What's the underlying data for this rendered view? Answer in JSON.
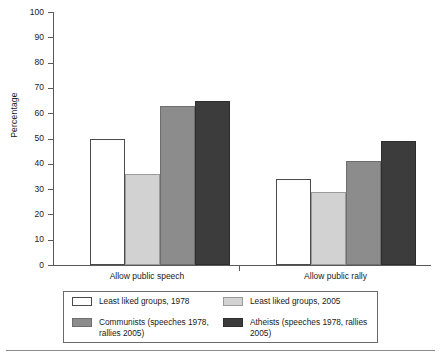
{
  "chart_data": {
    "type": "bar",
    "title": "",
    "xlabel": "",
    "ylabel": "Percentage",
    "ylim": [
      0,
      100
    ],
    "ytick_step": 10,
    "yticks": [
      100,
      90,
      80,
      70,
      60,
      50,
      40,
      30,
      20,
      10,
      0
    ],
    "grid": false,
    "legend_position": "bottom",
    "categories": [
      "Allow public speech",
      "Allow public rally"
    ],
    "series": [
      {
        "name": "Least liked groups, 1978",
        "color": "#ffffff",
        "values": [
          50,
          34
        ]
      },
      {
        "name": "Least liked groups, 2005",
        "color": "#d2d2d2",
        "values": [
          36,
          29
        ]
      },
      {
        "name": "Communists (speeches 1978, rallies 2005)",
        "color": "#8c8c8c",
        "values": [
          63,
          41
        ]
      },
      {
        "name": "Atheists (speeches 1978, rallies 2005)",
        "color": "#3c3c3c",
        "values": [
          65,
          49
        ]
      }
    ]
  },
  "axis": {
    "y_label": "Percentage",
    "tick_labels": [
      "100",
      "90",
      "80",
      "70",
      "60",
      "50",
      "40",
      "30",
      "20",
      "10",
      "0"
    ]
  },
  "categories": {
    "label_0": "Allow public speech",
    "label_1": "Allow public rally"
  },
  "legend": {
    "entries": [
      {
        "label": "Least liked groups, 1978",
        "swatch": "legend-swatch-white"
      },
      {
        "label": "Least liked groups, 2005",
        "swatch": "legend-swatch-light-gray"
      },
      {
        "label": "Communists (speeches 1978, rallies 2005)",
        "swatch": "legend-swatch-mid-gray"
      },
      {
        "label": "Atheists (speeches 1978, rallies 2005)",
        "swatch": "legend-swatch-dark-gray"
      }
    ]
  },
  "colors": {
    "series_0": "#ffffff",
    "series_1": "#d2d2d2",
    "series_2": "#8c8c8c",
    "series_3": "#3c3c3c",
    "axis": "#5a5a5a",
    "text": "#1a1a1a"
  }
}
